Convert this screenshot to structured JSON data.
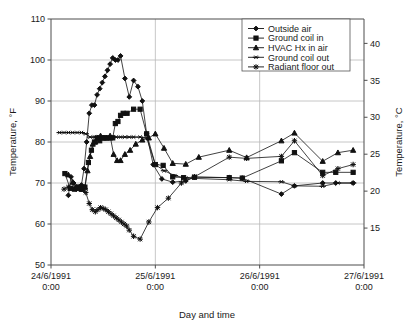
{
  "chart_data": {
    "type": "line",
    "title": "",
    "xlabel": "Day and time",
    "ylabel": "Temperature, °F",
    "ylabel_right": "Temperature, °C",
    "ylim": [
      50,
      110
    ],
    "yticks": [
      50,
      60,
      70,
      80,
      90,
      100,
      110
    ],
    "ylim_right": [
      10,
      43.3
    ],
    "yticks_right": [
      15,
      20,
      25,
      30,
      35,
      40
    ],
    "xlim_hours": [
      0,
      72
    ],
    "xticks_hours": [
      0,
      24,
      48,
      72
    ],
    "xtick_labels": [
      "24/6/1991\n0:00",
      "25/6/1991\n0:00",
      "26/6/1991\n0:00",
      "27/6/1991\n0:00"
    ],
    "xtick_labels_line1": [
      "24/6/1991",
      "25/6/1991",
      "26/6/1991",
      "27/6/1991"
    ],
    "xtick_labels_line2": [
      "0:00",
      "0:00",
      "0:00",
      "0:00"
    ],
    "grid": "horizontal-and-vertical",
    "legend_position": "top-right",
    "series": [
      {
        "name": "Outside air",
        "marker": "diamond",
        "x": [
          4.0,
          4.6,
          5.2,
          5.8,
          6.4,
          7.0,
          7.6,
          8.2,
          8.8,
          9.4,
          10.0,
          10.6,
          11.2,
          11.8,
          12.4,
          13.0,
          13.6,
          14.2,
          14.8,
          15.4,
          16.0,
          17.0,
          18.0,
          19.0,
          20.0,
          21.0,
          22.0,
          23.5,
          25.5,
          28.0,
          31.0,
          33.0,
          41.0,
          44.0,
          53.0,
          56.0,
          62.5,
          65.5,
          69.5
        ],
        "y": [
          67.0,
          71.5,
          70.0,
          68.5,
          69.0,
          69.5,
          73.5,
          80.0,
          87.0,
          89.0,
          89.0,
          91.5,
          93.0,
          94.5,
          96.0,
          97.5,
          99.0,
          100.5,
          100.0,
          100.0,
          101.0,
          95.5,
          91.0,
          95.0,
          93.5,
          90.0,
          82.0,
          74.5,
          71.0,
          70.2,
          70.5,
          71.5,
          71.3,
          71.2,
          67.3,
          69.3,
          70.0,
          70.0,
          70.0
        ]
      },
      {
        "name": "Ground coil in",
        "marker": "square",
        "x": [
          3.2,
          4.4,
          5.4,
          6.2,
          7.0,
          7.8,
          8.6,
          9.3,
          10.0,
          10.6,
          11.2,
          11.8,
          12.4,
          13.0,
          13.6,
          14.2,
          14.8,
          15.4,
          16.0,
          16.6,
          17.5,
          19.0,
          20.5,
          22.0,
          24.0,
          25.8,
          28.0,
          30.5,
          33.0,
          41.0,
          44.0,
          53.0,
          56.0,
          62.5,
          65.5,
          69.5
        ],
        "y": [
          72.3,
          68.7,
          68.5,
          69.0,
          68.5,
          69.0,
          75.0,
          78.0,
          80.0,
          81.0,
          80.3,
          81.0,
          81.0,
          81.0,
          81.0,
          81.0,
          84.5,
          85.0,
          86.5,
          87.0,
          87.0,
          88.0,
          88.0,
          82.0,
          74.5,
          74.3,
          71.5,
          71.3,
          71.4,
          71.3,
          71.2,
          75.4,
          77.4,
          72.6,
          72.6,
          72.6
        ]
      },
      {
        "name": "HVAC Hx in air",
        "marker": "triangle",
        "x": [
          4.0,
          5.0,
          5.8,
          6.6,
          7.2,
          7.8,
          8.4,
          9.0,
          9.6,
          10.2,
          10.8,
          11.4,
          12.0,
          12.8,
          13.6,
          14.4,
          15.2,
          16.0,
          17.0,
          18.2,
          19.5,
          21.0,
          22.5,
          24.0,
          26.0,
          28.0,
          31.0,
          34.0,
          41.0,
          45.0,
          53.0,
          56.0,
          62.5,
          66.0,
          69.5
        ],
        "y": [
          72.0,
          70.2,
          69.0,
          68.7,
          68.5,
          69.0,
          73.0,
          76.5,
          79.5,
          80.0,
          81.0,
          81.5,
          81.0,
          81.0,
          81.5,
          77.0,
          75.5,
          75.5,
          77.0,
          78.0,
          79.5,
          80.5,
          81.0,
          82.0,
          78.5,
          74.8,
          74.6,
          76.3,
          78.0,
          76.2,
          80.3,
          82.2,
          75.3,
          77.4,
          78.0
        ]
      },
      {
        "name": "Ground coil out",
        "marker": "cross-bar",
        "x": [
          2.0,
          3.0,
          4.0,
          5.0,
          6.0,
          7.0,
          8.0,
          9.0,
          10.0,
          11.0,
          12.0,
          13.0,
          14.0,
          15.0,
          16.0,
          17.0,
          18.0,
          19.0,
          20.5,
          22.0,
          24.0,
          26.0,
          28.5,
          31.0,
          41.0,
          45.0,
          53.0,
          56.0,
          62.5,
          66.0,
          69.5
        ],
        "y": [
          82.3,
          82.3,
          82.3,
          82.3,
          82.3,
          82.3,
          82.0,
          81.2,
          81.2,
          81.2,
          81.2,
          81.2,
          81.2,
          81.2,
          81.2,
          81.2,
          81.2,
          81.2,
          81.2,
          81.0,
          74.5,
          73.0,
          71.8,
          71.2,
          70.8,
          70.4,
          70.3,
          69.3,
          69.2,
          70.0,
          70.0
        ]
      },
      {
        "name": "Radiant floor out",
        "marker": "star",
        "x": [
          3.0,
          4.0,
          5.0,
          6.0,
          7.0,
          8.0,
          8.8,
          9.5,
          10.2,
          10.8,
          11.4,
          12.0,
          12.6,
          13.2,
          13.8,
          14.4,
          15.0,
          15.6,
          16.2,
          16.8,
          17.4,
          18.0,
          19.0,
          20.5,
          22.5,
          24.5,
          27.0,
          30.0,
          33.0,
          41.0,
          45.0,
          53.0,
          56.0,
          62.5,
          66.0,
          69.5
        ],
        "y": [
          68.5,
          69.0,
          68.8,
          69.0,
          68.5,
          67.7,
          65.0,
          63.5,
          63.0,
          63.5,
          64.0,
          63.8,
          63.5,
          63.0,
          62.5,
          62.0,
          61.5,
          61.0,
          60.5,
          60.0,
          59.5,
          58.5,
          57.0,
          56.3,
          60.5,
          64.0,
          66.3,
          70.0,
          71.5,
          76.3,
          76.0,
          76.5,
          80.3,
          71.8,
          73.5,
          74.5
        ]
      }
    ]
  }
}
